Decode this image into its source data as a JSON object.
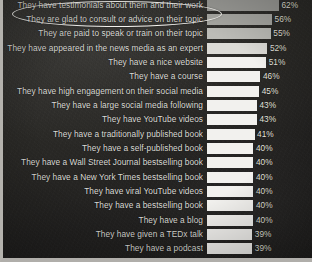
{
  "slide": {
    "background_color": "#2a2926",
    "border_color": "#b2b0ab",
    "annotation": {
      "type": "ellipse-highlight",
      "target_label": "They have testimonials about them and their work",
      "color": "#f4f3ef"
    }
  },
  "chart_data": {
    "type": "bar",
    "orientation": "horizontal",
    "title": "",
    "subtitle": "",
    "xlabel": "",
    "ylabel": "",
    "grid": false,
    "legend": false,
    "xlim": [
      0,
      62
    ],
    "value_suffix": "%",
    "categories": [
      "They have testimonials about them and their work",
      "They are glad to consult or advice on their topic",
      "They are paid to speak or train on their topic",
      "They have appeared in the news media as an expert",
      "They have a nice website",
      "They have a course",
      "They have high engagement on their social media",
      "They have a large social media following",
      "They have YouTube videos",
      "They have a traditionally published book",
      "They have a self-published book",
      "They have a Wall Street Journal bestselling book",
      "They have a New York Times bestselling book",
      "They have viral YouTube videos",
      "They have a bestselling book",
      "They have a blog",
      "They have given a TEDx talk",
      "They have a podcast"
    ],
    "values": [
      62,
      56,
      55,
      52,
      51,
      46,
      45,
      43,
      43,
      41,
      40,
      40,
      40,
      40,
      40,
      40,
      39,
      39
    ],
    "value_labels": [
      "62%",
      "56%",
      "55%",
      "52%",
      "51%",
      "46%",
      "45%",
      "43%",
      "43%",
      "41%",
      "40%",
      "40%",
      "40%",
      "40%",
      "40%",
      "40%",
      "39%",
      "39%"
    ],
    "bar_colors": [
      "#9a9a96",
      "#a7a7a2",
      "#bcbcb7",
      "#dcdbd6",
      "#f2f1ee",
      "#f2f1ee",
      "#f2f1ee",
      "#f2f1ee",
      "#f2f1ee",
      "#f2f1ee",
      "#f2f1ee",
      "#f2f1ee",
      "#f2f1ee",
      "#f2f1ee",
      "#f2f1ee",
      "#f2f1ee",
      "#f2f1ee",
      "#f2f1ee"
    ]
  }
}
